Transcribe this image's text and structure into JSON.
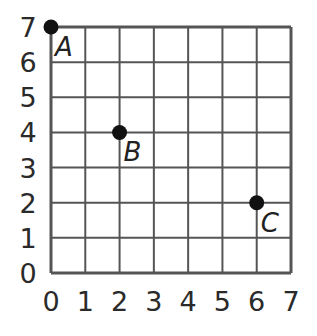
{
  "chart_data": {
    "type": "scatter",
    "title": "",
    "xlabel": "",
    "ylabel": "",
    "xlim": [
      0,
      7
    ],
    "ylim": [
      0,
      7
    ],
    "grid": true,
    "x_ticks": [
      "0",
      "1",
      "2",
      "3",
      "4",
      "5",
      "6",
      "7"
    ],
    "y_ticks": [
      "0",
      "1",
      "2",
      "3",
      "4",
      "5",
      "6",
      "7"
    ],
    "points": [
      {
        "label": "A",
        "x": 0,
        "y": 7
      },
      {
        "label": "B",
        "x": 2,
        "y": 4
      },
      {
        "label": "C",
        "x": 6,
        "y": 2
      }
    ]
  },
  "colors": {
    "grid": "#555555",
    "point": "#111111",
    "text": "#2a2a2a"
  }
}
